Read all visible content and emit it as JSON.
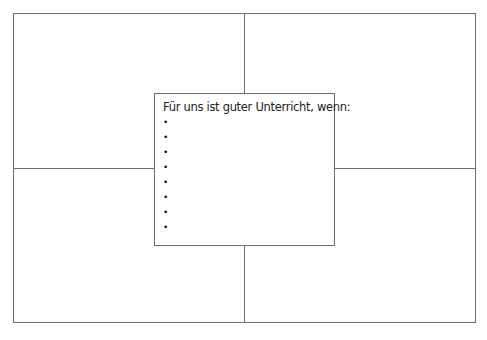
{
  "center": {
    "title": "Für uns ist guter Unterricht, wenn:",
    "bullets": [
      "",
      "",
      "",
      "",
      "",
      "",
      "",
      ""
    ]
  },
  "colors": {
    "line": "#6e6e6e",
    "background": "#ffffff"
  }
}
